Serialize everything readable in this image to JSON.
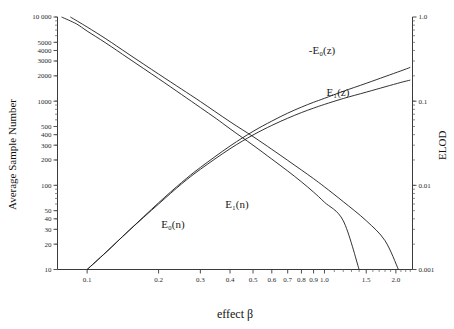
{
  "chart_data": {
    "type": "line",
    "title": "",
    "xlabel": "effect β",
    "ylabel": "Average Sample Number",
    "y2label": "ELOD",
    "xscale": "log",
    "yscale": "log",
    "y2scale": "log",
    "xlim": [
      0.075,
      2.35
    ],
    "ylim": [
      10,
      10000
    ],
    "y2lim": [
      0.001,
      1.0
    ],
    "grid": false,
    "legend_position": "inline-annotations",
    "xticks": [
      0.1,
      0.2,
      0.3,
      0.4,
      0.5,
      0.6,
      0.7,
      0.8,
      0.9,
      1.0,
      1.5,
      2.0
    ],
    "xticklabels": [
      "0.1",
      "0.2",
      "0.3",
      "0.4",
      "0.5",
      "0.6",
      "0.7",
      "0.8",
      "0.9",
      "1.0",
      "1.5",
      "2.0"
    ],
    "yticks": [
      10,
      20,
      30,
      40,
      50,
      100,
      200,
      300,
      400,
      500,
      1000,
      2000,
      3000,
      4000,
      5000,
      10000
    ],
    "yticklabels": [
      "10",
      "20",
      "30",
      "40",
      "50",
      "100",
      "200",
      "300",
      "400",
      "500",
      "1000",
      "2000",
      "3000",
      "4000",
      "5000",
      "10 000"
    ],
    "y2ticks": [
      0.001,
      0.01,
      0.1,
      1.0
    ],
    "y2ticklabels": [
      "0.001",
      "0.01",
      "0.1",
      "1.0"
    ],
    "series": [
      {
        "name": "E_0(n)",
        "label": "E",
        "label_sub": "0",
        "label_tail": "(n)",
        "axis": "left",
        "color": "#1c1c1c",
        "x": [
          0.078,
          0.09,
          0.1,
          0.12,
          0.15,
          0.2,
          0.25,
          0.3,
          0.35,
          0.4,
          0.5,
          0.6,
          0.7,
          0.8,
          0.9,
          1.0,
          1.2,
          1.4
        ],
        "y": [
          10000,
          8300,
          6800,
          4900,
          3200,
          1850,
          1200,
          840,
          620,
          470,
          300,
          205,
          148,
          110,
          83,
          63,
          38,
          10
        ]
      },
      {
        "name": "E_1(n)",
        "label": "E",
        "label_sub": "1",
        "label_tail": "(n)",
        "axis": "left",
        "color": "#1c1c1c",
        "x": [
          0.085,
          0.1,
          0.12,
          0.15,
          0.2,
          0.25,
          0.3,
          0.4,
          0.5,
          0.6,
          0.7,
          0.8,
          0.9,
          1.0,
          1.2,
          1.5,
          1.8,
          2.05
        ],
        "y": [
          10000,
          7600,
          5500,
          3600,
          2100,
          1390,
          990,
          570,
          380,
          268,
          198,
          152,
          120,
          96,
          64,
          38,
          22,
          10
        ]
      },
      {
        "name": "-E_0(z)",
        "label": "-E",
        "label_sub": "0",
        "label_tail": "(z)",
        "axis": "right",
        "color": "#1c1c1c",
        "x": [
          0.1,
          0.12,
          0.15,
          0.2,
          0.25,
          0.3,
          0.4,
          0.5,
          0.6,
          0.7,
          0.8,
          0.9,
          1.0,
          1.2,
          1.5,
          1.8,
          2.1,
          2.3
        ],
        "y": [
          0.001,
          0.0016,
          0.0029,
          0.0062,
          0.0108,
          0.0163,
          0.0293,
          0.0437,
          0.058,
          0.072,
          0.085,
          0.097,
          0.108,
          0.131,
          0.163,
          0.196,
          0.229,
          0.252
        ]
      },
      {
        "name": "E_1(z)",
        "label": "E",
        "label_sub": "1",
        "label_tail": "(z)",
        "axis": "right",
        "color": "#1c1c1c",
        "x": [
          0.1,
          0.12,
          0.15,
          0.2,
          0.25,
          0.3,
          0.4,
          0.5,
          0.6,
          0.7,
          0.8,
          0.9,
          1.0,
          1.2,
          1.5,
          1.8,
          2.1,
          2.3
        ],
        "y": [
          0.001,
          0.0016,
          0.0029,
          0.006,
          0.0104,
          0.0155,
          0.0272,
          0.0396,
          0.0515,
          0.0627,
          0.0732,
          0.0827,
          0.0915,
          0.1075,
          0.128,
          0.148,
          0.167,
          0.178
        ]
      }
    ],
    "annotations": [
      {
        "name": "neg-e0-z-label",
        "text": "-E₀(z)",
        "x_px": 322,
        "y_px": 54
      },
      {
        "name": "e1-z-label",
        "text": "E₁(z)",
        "x_px": 338,
        "y_px": 96
      },
      {
        "name": "e1-n-label",
        "text": "E₁(n)",
        "x_px": 237,
        "y_px": 208
      },
      {
        "name": "e0-n-label",
        "text": "E₀(n)",
        "x_px": 173,
        "y_px": 228
      }
    ]
  },
  "axes": {
    "left_title": "Average Sample Number",
    "right_title": "ELOD",
    "bottom_title": "effect β"
  }
}
